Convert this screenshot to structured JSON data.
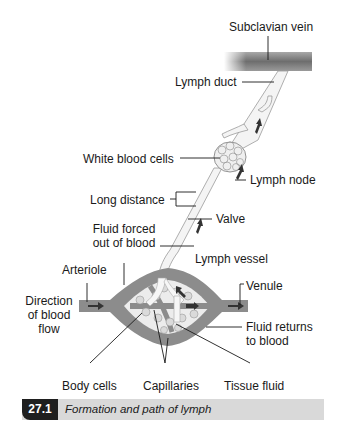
{
  "figure": {
    "labels": {
      "subclavian_vein": "Subclavian vein",
      "lymph_duct": "Lymph duct",
      "white_blood_cells": "White blood cells",
      "lymph_node": "Lymph node",
      "long_distance": "Long distance",
      "valve": "Valve",
      "fluid_forced_line1": "Fluid forced",
      "fluid_forced_line2": "out of blood",
      "lymph_vessel": "Lymph vessel",
      "arteriole": "Arteriole",
      "venule": "Venule",
      "direction_line1": "Direction",
      "direction_line2": "of blood",
      "direction_line3": "flow",
      "fluid_returns_line1": "Fluid returns",
      "fluid_returns_line2": "to blood",
      "body_cells": "Body cells",
      "capillaries": "Capillaries",
      "tissue_fluid": "Tissue fluid"
    },
    "caption": {
      "number": "27.1",
      "text": "Formation and path of lymph"
    },
    "colors": {
      "vein": "#7a7a7a",
      "blood_vessel": "#8c8c8c",
      "lymph": "#f2f2f2",
      "caption_bg": "#d9d9d9",
      "caption_num_bg": "#1f1f1f"
    }
  }
}
